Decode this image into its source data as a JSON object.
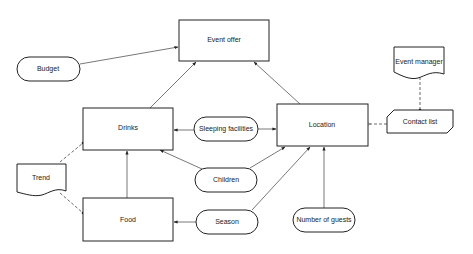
{
  "diagram": {
    "nodes": {
      "event_offer": {
        "label": "Event offer",
        "shape": "rectangle"
      },
      "budget": {
        "label": "Budget",
        "shape": "rounded"
      },
      "drinks": {
        "label": "Drinks",
        "shape": "rectangle"
      },
      "sleeping_facilities": {
        "label": "Sleeping facilities",
        "shape": "rounded"
      },
      "location": {
        "label": "Location",
        "shape": "rectangle"
      },
      "event_manager": {
        "label": "Event manager",
        "shape": "document"
      },
      "contact_list": {
        "label": "Contact list",
        "shape": "card"
      },
      "trend": {
        "label": "Trend",
        "shape": "document"
      },
      "children": {
        "label": "Children",
        "shape": "rounded"
      },
      "food": {
        "label": "Food",
        "shape": "rectangle"
      },
      "season": {
        "label": "Season",
        "shape": "rounded"
      },
      "number_of_guests": {
        "label": "Number of guests",
        "shape": "rounded"
      }
    },
    "edges": [
      {
        "from": "Budget",
        "to": "Event offer",
        "style": "solid"
      },
      {
        "from": "Drinks",
        "to": "Event offer",
        "style": "solid"
      },
      {
        "from": "Location",
        "to": "Event offer",
        "style": "solid"
      },
      {
        "from": "Sleeping facilities",
        "to": "Drinks",
        "style": "solid"
      },
      {
        "from": "Sleeping facilities",
        "to": "Location",
        "style": "solid"
      },
      {
        "from": "Children",
        "to": "Drinks",
        "style": "solid"
      },
      {
        "from": "Children",
        "to": "Location",
        "style": "solid"
      },
      {
        "from": "Food",
        "to": "Drinks",
        "style": "solid"
      },
      {
        "from": "Season",
        "to": "Food",
        "style": "solid"
      },
      {
        "from": "Season",
        "to": "Location",
        "style": "solid"
      },
      {
        "from": "Number of guests",
        "to": "Location",
        "style": "solid"
      },
      {
        "from": "Contact list",
        "to": "Location",
        "style": "dashed"
      },
      {
        "from": "Event manager",
        "to": "Contact list",
        "style": "dashed"
      },
      {
        "from": "Trend",
        "to": "Drinks",
        "style": "dashed"
      },
      {
        "from": "Trend",
        "to": "Food",
        "style": "dashed"
      }
    ],
    "colors": {
      "stroke": "#222222",
      "edge": "#555555",
      "background": "#ffffff"
    }
  }
}
